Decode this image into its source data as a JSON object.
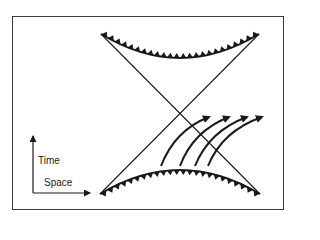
{
  "diagram": {
    "title": "",
    "axes": {
      "vertical_label": "Time",
      "horizontal_label": "Space"
    },
    "colors": {
      "ink": "#1a1a1a",
      "frame": "#3a3a3a",
      "background": "#ffffff"
    },
    "elements": [
      "top-boundary-arc-with-teeth",
      "bottom-boundary-arc-with-teeth",
      "diagonal-line-left-to-right",
      "diagonal-line-right-to-left",
      "four-curved-arrows"
    ]
  }
}
